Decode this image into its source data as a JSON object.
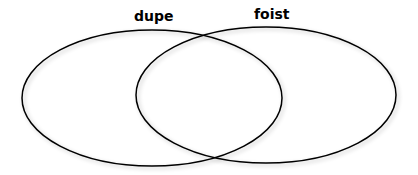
{
  "diagram": {
    "type": "venn",
    "sets": [
      {
        "label": "dupe",
        "cx": 152,
        "cy": 98,
        "rx": 130,
        "ry": 68
      },
      {
        "label": "foist",
        "cx": 266,
        "cy": 95,
        "rx": 130,
        "ry": 68
      }
    ],
    "stroke_color": "#000000",
    "background": "#ffffff"
  }
}
